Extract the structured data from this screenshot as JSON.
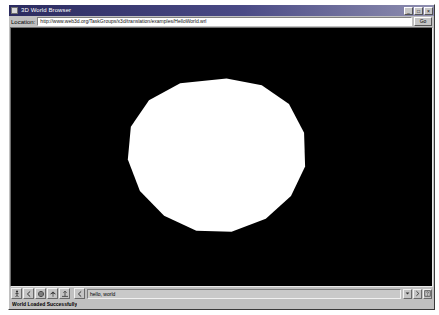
{
  "window": {
    "title": "3D World Browser",
    "icon": "globe-icon",
    "buttons": [
      {
        "name": "minimize",
        "glyph": "_"
      },
      {
        "name": "maximize",
        "glyph": "□"
      },
      {
        "name": "close",
        "glyph": "×"
      }
    ]
  },
  "location_bar": {
    "label": "Location:",
    "url": "http://www.web3d.org/TaskGroups/x3d/translation/examples/HelloWorld.wrl",
    "placeholder": "Enter world URL",
    "go_label": "Go"
  },
  "viewport": {
    "background_color": "#000000",
    "shape_color": "#ffffff",
    "shape": "polygon-sphere"
  },
  "toolbar": {
    "buttons": [
      {
        "name": "walk-navigation-button",
        "icon": "walk-icon"
      },
      {
        "name": "pan-left-button",
        "icon": "chevron-left-icon"
      },
      {
        "name": "examine-navigation-button",
        "icon": "examine-icon"
      },
      {
        "name": "fly-navigation-button",
        "icon": "fly-icon"
      },
      {
        "name": "straighten-view-button",
        "icon": "straighten-icon"
      }
    ],
    "viewpoint_prev": {
      "name": "previous-viewpoint-button",
      "icon": "chevron-left-icon"
    },
    "command_field": {
      "value": "hello, world",
      "placeholder": "Viewpoint"
    },
    "dropdown": {
      "name": "viewpoint-dropdown",
      "icon": "chevron-down-icon"
    },
    "next_viewpoint": {
      "name": "next-viewpoint-button",
      "icon": "chevron-right-icon"
    },
    "help_button": {
      "name": "help-button",
      "icon": "help-icon"
    }
  },
  "status_bar": {
    "message": "World Loaded Successfully"
  }
}
